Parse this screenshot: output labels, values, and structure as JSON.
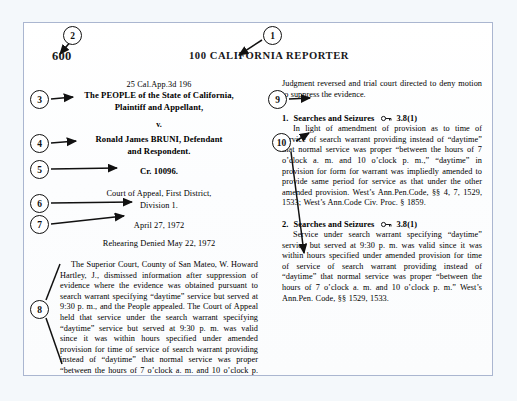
{
  "page": {
    "folio": "600",
    "running_head": "100 CALIFORNIA REPORTER"
  },
  "caption": {
    "citation": "25 Cal.App.3d 196",
    "plaintiff": "The PEOPLE of the State of California,",
    "plaintiff_role": "Plaintiff and Appellant,",
    "versus": "v.",
    "defendant": "Ronald James BRUNI, Defendant",
    "defendant_role": "and Respondent.",
    "docket": "Cr. 10096.",
    "court_line1": "Court of Appeal, First District,",
    "court_line2": "Division 1.",
    "decided": "April 27, 1972",
    "rehearing": "Rehearing Denied May 22, 1972"
  },
  "syllabus": {
    "text": "The Superior Court, County of San Mateo, W. Howard Hartley, J., dismissed information after suppression of evidence where the evidence was obtained pursuant to search warrant specifying “daytime” service but served at 9:30 p. m., and the People appealed. The Court of Appeal held that service under the search warrant specifying “daytime” service but served at 9:30 p. m. was valid since it was within hours specified under amended provision for time of service of search warrant providing instead of “daytime” that normal service was proper “between the hours of 7 o’clock a. m. and 10 o’clock p. m.”"
  },
  "disposition": {
    "text": "Judgment reversed and trial court directed to deny motion to suppress the evidence."
  },
  "headnotes": [
    {
      "number": "1.",
      "topic": "Searches and Seizures",
      "key_icon": "west-key-icon",
      "key_number": "3.8(1)",
      "body": "In light of amendment of provision as to time of service of search warrant providing instead of “daytime” that normal service was proper “between the hours of 7 o’clock a. m. and 10 o’clock p. m.,” “daytime” in provision for form for warrant was impliedly amended to provide same period for service as that under the other amended provision. West’s Ann.Pen.Code, §§ 4, 7, 1529, 1533; West’s Ann.Code Civ. Proc. § 1859."
    },
    {
      "number": "2.",
      "topic": "Searches and Seizures",
      "key_icon": "west-key-icon",
      "key_number": "3.8(1)",
      "body": "Service under search warrant specifying “daytime” service but served at 9:30 p. m. was valid since it was within hours specified under amended provision for time of service of search warrant providing instead of “daytime” that normal service was proper “between the hours of 7 o’clock a. m. and 10 o’clock p. m.” West’s Ann.Pen. Code, §§ 1529, 1533."
    }
  ],
  "callouts": [
    {
      "id": "1",
      "label": "1"
    },
    {
      "id": "2",
      "label": "2"
    },
    {
      "id": "3",
      "label": "3"
    },
    {
      "id": "4",
      "label": "4"
    },
    {
      "id": "5",
      "label": "5"
    },
    {
      "id": "6",
      "label": "6"
    },
    {
      "id": "7",
      "label": "7"
    },
    {
      "id": "8",
      "label": "8"
    },
    {
      "id": "9",
      "label": "9"
    },
    {
      "id": "10",
      "label": "10"
    }
  ],
  "colors": {
    "page_border": "#aab6d0",
    "page_background": "#fdfefe",
    "backdrop": "#f4f8fb",
    "ink": "#17171a",
    "annotation": "#111111"
  }
}
